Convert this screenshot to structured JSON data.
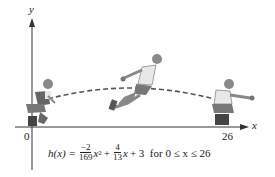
{
  "axes": {
    "x_label": "x",
    "y_label": "y",
    "origin_label": "0",
    "x_end_label": "26"
  },
  "formula": {
    "lhs": "h(x) =",
    "frac1_num": "−2",
    "frac1_den": "169",
    "term1_var": "x",
    "term1_exp": "2",
    "plus1": "+",
    "frac2_num": "4",
    "frac2_den": "13",
    "term2_var": "x",
    "rest": "+ 3  for 0 ≤ x ≤ 26"
  },
  "figures": [
    {
      "name": "crouching-jumper-start",
      "position": "x=0"
    },
    {
      "name": "jumper-midair",
      "position": "apex"
    },
    {
      "name": "crouching-jumper-landing",
      "position": "x=26"
    }
  ],
  "colors": {
    "ink": "#222222",
    "trajectory": "#555555",
    "shirt": "#e8e8e8",
    "shorts": "#777777",
    "skin": "#9a9a9a"
  }
}
